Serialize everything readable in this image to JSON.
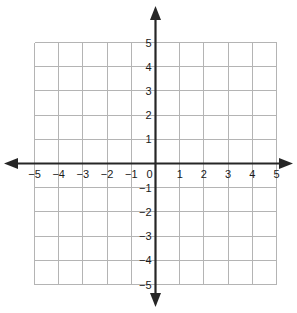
{
  "chart_data": {
    "type": "scatter",
    "title": "",
    "subtitle": "",
    "xlabel": "",
    "ylabel": "",
    "xlim": [
      -5,
      5
    ],
    "ylim": [
      -5,
      5
    ],
    "x_ticks": [
      -5,
      -4,
      -3,
      -2,
      -1,
      1,
      2,
      3,
      4,
      5
    ],
    "y_ticks": [
      5,
      4,
      3,
      2,
      1,
      -1,
      -2,
      -3,
      -4,
      -5
    ],
    "x_tick_labels": [
      "−5",
      "−4",
      "−3",
      "−2",
      "−1",
      "1",
      "2",
      "3",
      "4",
      "5"
    ],
    "y_tick_labels": [
      "5",
      "4",
      "3",
      "2",
      "1",
      "−1",
      "−2",
      "−3",
      "−4",
      "−5"
    ],
    "origin_label": "0",
    "grid": true,
    "grid_step": 1,
    "legend": null,
    "series": [],
    "annotations": [],
    "axis_arrows": [
      "left",
      "right",
      "up",
      "down"
    ],
    "colors": {
      "grid": "#b4b4b4",
      "axis": "#262626",
      "label": "#1a1a1a",
      "background": "#ffffff"
    }
  },
  "axes": {
    "x_axis_name": "x-axis",
    "y_axis_name": "y-axis"
  }
}
